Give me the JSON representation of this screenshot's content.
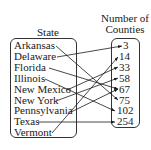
{
  "left_header": "State",
  "right_header": [
    "Number of",
    "Counties"
  ],
  "states": [
    "Arkansas",
    "Delaware",
    "Florida",
    "Illinois",
    "New Mexico",
    "New York",
    "Pennsylvania",
    "Texas",
    "Vermont"
  ],
  "counts": [
    "3",
    "14",
    "33",
    "58",
    "67",
    "75",
    "102",
    "254"
  ],
  "mapping": [
    {
      "state": "Arkansas",
      "count": "75"
    },
    {
      "state": "Delaware",
      "count": "3"
    },
    {
      "state": "Florida",
      "count": "67"
    },
    {
      "state": "Illinois",
      "count": "102"
    },
    {
      "state": "New Mexico",
      "count": "33"
    },
    {
      "state": "New York",
      "count": "58"
    },
    {
      "state": "Pennsylvania",
      "count": "67"
    },
    {
      "state": "Texas",
      "count": "254"
    },
    {
      "state": "Vermont",
      "count": "14"
    }
  ]
}
